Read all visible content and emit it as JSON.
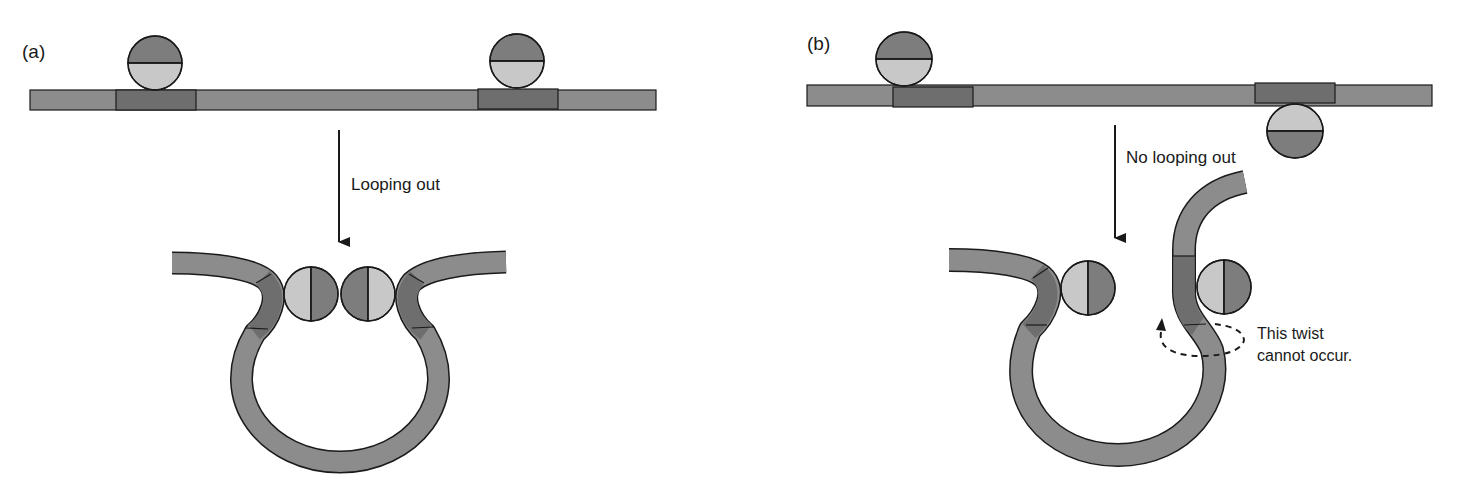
{
  "panels": {
    "a": {
      "label": "(a)",
      "arrow_label": "Looping out"
    },
    "b": {
      "label": "(b)",
      "arrow_label": "No looping out",
      "annotation_line1": "This twist",
      "annotation_line2": "cannot occur."
    }
  },
  "colors": {
    "dna": "#8c8c8c",
    "binding_site": "#6e6e6e",
    "protein_dark": "#7d7d7d",
    "protein_light": "#c8c8c8",
    "stroke": "#1a1a1a"
  }
}
